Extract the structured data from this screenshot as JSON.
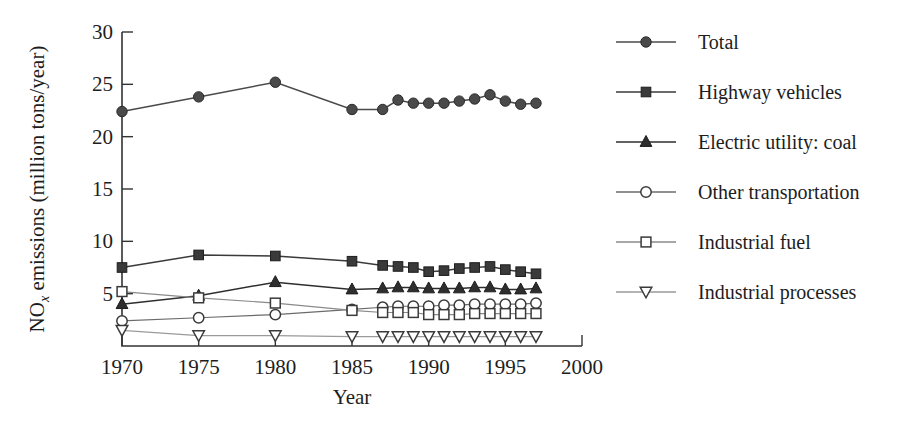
{
  "chart_data": {
    "type": "line",
    "title": "",
    "xlabel": "Year",
    "ylabel": "NOx emissions (million tons/year)",
    "ylabel_main": "NO",
    "ylabel_sub": "x",
    "ylabel_rest": " emissions (million tons/year)",
    "xlim": [
      1970,
      2000
    ],
    "ylim": [
      0,
      30
    ],
    "xticks": [
      1970,
      1975,
      1980,
      1985,
      1990,
      1995,
      2000
    ],
    "xtick_labels": [
      "1970",
      "1975",
      "1980",
      "1985",
      "1990",
      "1995",
      "2000"
    ],
    "yticks": [
      0,
      5,
      10,
      15,
      20,
      25,
      30
    ],
    "ytick_labels": [
      "",
      "5",
      "10",
      "15",
      "20",
      "25",
      "30"
    ],
    "grid": false,
    "legend_position": "right",
    "series": [
      {
        "name": "Total",
        "marker": "filled-circle",
        "color": "#4a4a4a",
        "x": [
          1970,
          1975,
          1980,
          1985,
          1987,
          1988,
          1989,
          1990,
          1991,
          1992,
          1993,
          1994,
          1995,
          1996,
          1997
        ],
        "values": [
          22.4,
          23.8,
          25.2,
          22.6,
          22.6,
          23.5,
          23.2,
          23.2,
          23.2,
          23.4,
          23.6,
          24.0,
          23.4,
          23.1,
          23.2
        ]
      },
      {
        "name": "Highway vehicles",
        "marker": "filled-square",
        "color": "#3a3a3a",
        "x": [
          1970,
          1975,
          1980,
          1985,
          1987,
          1988,
          1989,
          1990,
          1991,
          1992,
          1993,
          1994,
          1995,
          1996,
          1997
        ],
        "values": [
          7.5,
          8.7,
          8.6,
          8.1,
          7.7,
          7.6,
          7.5,
          7.1,
          7.2,
          7.4,
          7.5,
          7.6,
          7.3,
          7.1,
          6.9
        ]
      },
      {
        "name": "Electric utility: coal",
        "marker": "filled-triangle",
        "color": "#2e2e2e",
        "x": [
          1970,
          1975,
          1980,
          1985,
          1987,
          1988,
          1989,
          1990,
          1991,
          1992,
          1993,
          1994,
          1995,
          1996,
          1997
        ],
        "values": [
          4.0,
          4.8,
          6.1,
          5.4,
          5.5,
          5.6,
          5.6,
          5.5,
          5.5,
          5.5,
          5.6,
          5.6,
          5.4,
          5.4,
          5.5
        ]
      },
      {
        "name": "Other transportation",
        "marker": "open-circle",
        "color": "#6b6b6b",
        "x": [
          1970,
          1975,
          1980,
          1985,
          1987,
          1988,
          1989,
          1990,
          1991,
          1992,
          1993,
          1994,
          1995,
          1996,
          1997
        ],
        "values": [
          2.4,
          2.7,
          3.0,
          3.5,
          3.7,
          3.8,
          3.8,
          3.8,
          3.9,
          3.9,
          4.0,
          4.0,
          4.0,
          4.0,
          4.1
        ]
      },
      {
        "name": "Industrial fuel",
        "marker": "open-square",
        "color": "#8a8a8a",
        "x": [
          1970,
          1975,
          1980,
          1985,
          1987,
          1988,
          1989,
          1990,
          1991,
          1992,
          1993,
          1994,
          1995,
          1996,
          1997
        ],
        "values": [
          5.2,
          4.6,
          4.1,
          3.4,
          3.2,
          3.2,
          3.2,
          3.0,
          3.0,
          3.0,
          3.1,
          3.1,
          3.1,
          3.1,
          3.1
        ]
      },
      {
        "name": "Industrial processes",
        "marker": "open-triangle-down",
        "color": "#9a9a9a",
        "x": [
          1970,
          1975,
          1980,
          1985,
          1987,
          1988,
          1989,
          1990,
          1991,
          1992,
          1993,
          1994,
          1995,
          1996,
          1997
        ],
        "values": [
          1.5,
          1.0,
          1.0,
          0.9,
          0.9,
          0.9,
          0.9,
          0.9,
          0.9,
          0.9,
          0.9,
          0.9,
          0.9,
          0.9,
          0.9
        ]
      }
    ]
  },
  "legend": {
    "items": [
      {
        "label": "Total",
        "marker": "filled-circle",
        "color": "#4a4a4a"
      },
      {
        "label": "Highway vehicles",
        "marker": "filled-square",
        "color": "#3a3a3a"
      },
      {
        "label": "Electric utility: coal",
        "marker": "filled-triangle",
        "color": "#2e2e2e"
      },
      {
        "label": "Other transportation",
        "marker": "open-circle",
        "color": "#6b6b6b"
      },
      {
        "label": "Industrial fuel",
        "marker": "open-square",
        "color": "#8a8a8a"
      },
      {
        "label": "Industrial processes",
        "marker": "open-triangle-down",
        "color": "#9a9a9a"
      }
    ]
  }
}
